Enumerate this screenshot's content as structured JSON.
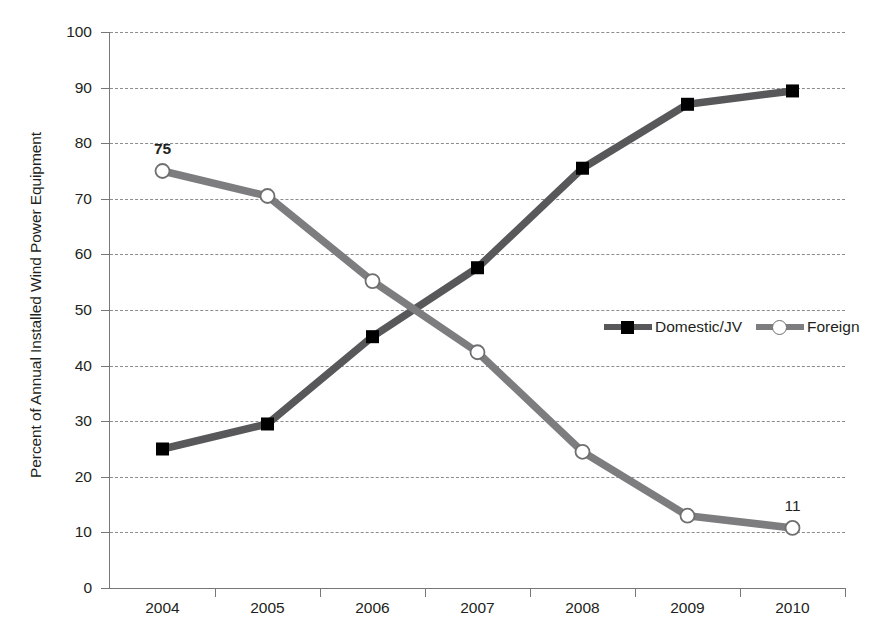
{
  "chart_data": {
    "type": "line",
    "title": "",
    "xlabel": "",
    "ylabel": "Percent of Annual Installed Wind Power Equipment",
    "categories": [
      "2004",
      "2005",
      "2006",
      "2007",
      "2008",
      "2009",
      "2010"
    ],
    "ylim": [
      0,
      100
    ],
    "ytick_step": 10,
    "yticks": [
      "100",
      "90",
      "80",
      "70",
      "60",
      "50",
      "40",
      "30",
      "20",
      "10",
      "0"
    ],
    "grid": true,
    "grid_style": "dashed-horizontal",
    "legend_position": "inside-center-right",
    "series": [
      {
        "name": "Domestic/JV",
        "values": [
          25.0,
          29.5,
          45.2,
          57.6,
          75.5,
          87.0,
          89.4
        ],
        "color": "#58585a",
        "marker": "square",
        "marker_color": "#000000"
      },
      {
        "name": "Foreign",
        "values": [
          75.0,
          70.5,
          55.2,
          42.4,
          24.5,
          13.0,
          10.8
        ],
        "color": "#7d7d80",
        "marker": "circle",
        "marker_color": "#ffffff"
      }
    ],
    "annotations": [
      {
        "text": "75",
        "series": "Foreign",
        "category": "2004",
        "value": 75.0,
        "bold": true
      },
      {
        "text": "11",
        "series": "Foreign",
        "category": "2010",
        "value": 10.8,
        "bold": false
      }
    ],
    "colors": {
      "domestic_line": "#58585a",
      "foreign_line": "#7d7d80",
      "grid": "#8c8c8c",
      "axis": "#77777a",
      "text": "#231f20",
      "background": "#ffffff"
    }
  }
}
